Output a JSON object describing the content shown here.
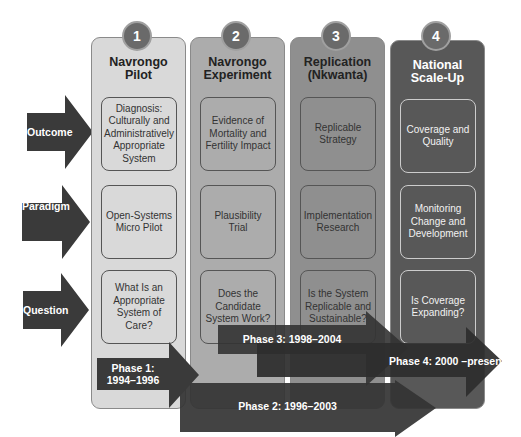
{
  "rows": [
    {
      "label": "Outcome",
      "icon": "arrow-right-icon"
    },
    {
      "label": "Paradigm",
      "icon": "arrow-right-icon"
    },
    {
      "label": "Question",
      "icon": "arrow-right-icon"
    }
  ],
  "columns": [
    {
      "number": "1",
      "title": "Navrongo\nPilot",
      "outcome": "Diagnosis:\nCulturally and\nAdministratively\nAppropriate\nSystem",
      "paradigm": "Open-Systems\nMicro Pilot",
      "question": "What Is an\nAppropriate\nSystem of\nCare?"
    },
    {
      "number": "2",
      "title": "Navrongo\nExperiment",
      "outcome": "Evidence of\nMortality and\nFertility Impact",
      "paradigm": "Plausibility\nTrial",
      "question": "Does the\nCandidate\nSystem Work?"
    },
    {
      "number": "3",
      "title": "Replication\n(Nkwanta)",
      "outcome": "Replicable\nStrategy",
      "paradigm": "Implementation\nResearch",
      "question": "Is the System\nReplicable and\nSustainable?"
    },
    {
      "number": "4",
      "title": "National\nScale-Up",
      "outcome": "Coverage and\nQuality",
      "paradigm": "Monitoring\nChange and\nDevelopment",
      "question": "Is Coverage\nExpanding?"
    }
  ],
  "phases": [
    {
      "label": "Phase 1:\n1994–1996"
    },
    {
      "label": "Phase 2: 1996–2003"
    },
    {
      "label": "Phase 3:  1998–2004"
    },
    {
      "label": "Phase 4: 2000 –present"
    }
  ],
  "colors": {
    "col1": "#d9d9d9",
    "col2": "#acacac",
    "col3": "#8f8f8f",
    "col4": "#585858",
    "arrow": "#3a3a3a",
    "circle": "#6a6a6a"
  }
}
